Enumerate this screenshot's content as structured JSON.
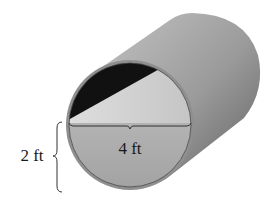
{
  "diagram": {
    "labels": {
      "water_width": "4 ft",
      "water_depth": "2 ft"
    },
    "colors": {
      "pipe_body_light": "#bdbdbd",
      "pipe_body_dark": "#6e6e6e",
      "rim": "#9a9a9a",
      "interior_dark": "#111111",
      "interior_light": "#cfcfcf",
      "water": "#a9a9a9",
      "line": "#333333"
    }
  }
}
